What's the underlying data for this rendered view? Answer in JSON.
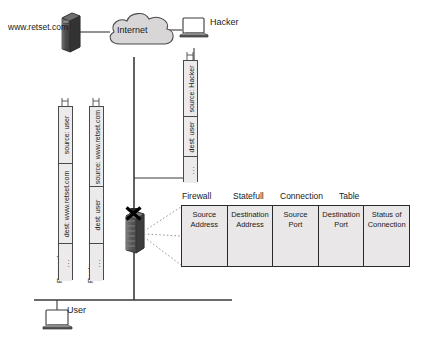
{
  "diagram": {
    "title_words": [
      "Firewall",
      "Statefull",
      "Connection",
      "Table"
    ],
    "nodes": {
      "web_server_label": "www.retset.com",
      "internet_label": "Internet",
      "hacker_label": "Hacker",
      "user_label": "User",
      "firewall_marker": "X"
    },
    "packets": [
      {
        "name": "request",
        "side_label": "Request",
        "segments": [
          "source: user",
          "dest: www.retset.com",
          "..."
        ]
      },
      {
        "name": "reply",
        "side_label": "Reply",
        "segments": [
          "source: www.retset.com",
          "dest: user",
          "..."
        ]
      },
      {
        "name": "hacker",
        "side_label": "",
        "segments": [
          "source: Hacker",
          "dest: user",
          "..."
        ]
      }
    ],
    "table": {
      "columns": [
        {
          "line1": "Source",
          "line2": "Address"
        },
        {
          "line1": "Destination",
          "line2": "Address"
        },
        {
          "line1": "Source",
          "line2": "Port"
        },
        {
          "line1": "Destination",
          "line2": "Port"
        },
        {
          "line1": "Status of",
          "line2": "Connection"
        }
      ],
      "row_count": 4,
      "cell_content": "squiggle-placeholder"
    },
    "colors": {
      "line": "#3a3a3a",
      "cloud_fill": "#d8d6d6",
      "server_dark": "#4a4a4a",
      "table_fill": "#e9e7e7",
      "packet_fill": "#eceaea",
      "block_x": "#000000"
    }
  }
}
